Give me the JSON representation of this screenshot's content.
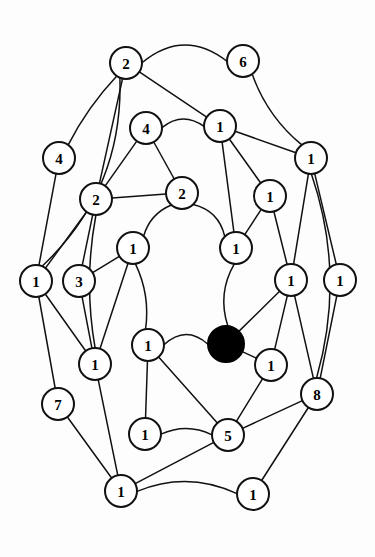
{
  "figure": {
    "name": "weighted-planar-graph",
    "background_color": "#fdfdfd",
    "node_fill": "#ffffff",
    "node_stroke": "#111111",
    "edge_color": "#111111",
    "highlight_color": "#000000",
    "width": 375,
    "height": 557
  },
  "chart_data": {
    "type": "diagram",
    "subtype": "node-link-graph",
    "title": "",
    "nodes": [
      {
        "id": "n1",
        "label": "2",
        "x": 126,
        "y": 63,
        "r": 16,
        "filled": false
      },
      {
        "id": "n2",
        "label": "6",
        "x": 243,
        "y": 61,
        "r": 16,
        "filled": false
      },
      {
        "id": "n3",
        "label": "4",
        "x": 146,
        "y": 128,
        "r": 16,
        "filled": false
      },
      {
        "id": "n4",
        "label": "1",
        "x": 220,
        "y": 126,
        "r": 16,
        "filled": false
      },
      {
        "id": "n5",
        "label": "1",
        "x": 311,
        "y": 158,
        "r": 16,
        "filled": false
      },
      {
        "id": "n6",
        "label": "4",
        "x": 59,
        "y": 158,
        "r": 16,
        "filled": false
      },
      {
        "id": "n7",
        "label": "2",
        "x": 96,
        "y": 199,
        "r": 16,
        "filled": false
      },
      {
        "id": "n8",
        "label": "2",
        "x": 182,
        "y": 193,
        "r": 16,
        "filled": false
      },
      {
        "id": "n9",
        "label": "1",
        "x": 270,
        "y": 196,
        "r": 16,
        "filled": false
      },
      {
        "id": "n10",
        "label": "1",
        "x": 133,
        "y": 248,
        "r": 16,
        "filled": false
      },
      {
        "id": "n11",
        "label": "1",
        "x": 236,
        "y": 248,
        "r": 16,
        "filled": false
      },
      {
        "id": "n12",
        "label": "1",
        "x": 36,
        "y": 281,
        "r": 16,
        "filled": false
      },
      {
        "id": "n13",
        "label": "3",
        "x": 79,
        "y": 281,
        "r": 16,
        "filled": false
      },
      {
        "id": "n14",
        "label": "1",
        "x": 291,
        "y": 280,
        "r": 16,
        "filled": false
      },
      {
        "id": "n15",
        "label": "1",
        "x": 340,
        "y": 280,
        "r": 16,
        "filled": false
      },
      {
        "id": "n16",
        "label": "",
        "x": 226,
        "y": 344,
        "r": 18,
        "filled": true
      },
      {
        "id": "n17",
        "label": "1",
        "x": 148,
        "y": 345,
        "r": 16,
        "filled": false
      },
      {
        "id": "n18",
        "label": "1",
        "x": 95,
        "y": 364,
        "r": 16,
        "filled": false
      },
      {
        "id": "n19",
        "label": "1",
        "x": 271,
        "y": 365,
        "r": 16,
        "filled": false
      },
      {
        "id": "n20",
        "label": "8",
        "x": 317,
        "y": 394,
        "r": 16,
        "filled": false
      },
      {
        "id": "n21",
        "label": "7",
        "x": 58,
        "y": 404,
        "r": 16,
        "filled": false
      },
      {
        "id": "n22",
        "label": "1",
        "x": 145,
        "y": 434,
        "r": 16,
        "filled": false
      },
      {
        "id": "n23",
        "label": "5",
        "x": 228,
        "y": 435,
        "r": 16,
        "filled": false
      },
      {
        "id": "n24",
        "label": "1",
        "x": 121,
        "y": 491,
        "r": 16,
        "filled": false
      },
      {
        "id": "n25",
        "label": "1",
        "x": 253,
        "y": 494,
        "r": 16,
        "filled": false
      }
    ],
    "edges": [
      {
        "from": "n1",
        "to": "n2",
        "curve": -34
      },
      {
        "from": "n1",
        "to": "n4",
        "curve": 0
      },
      {
        "from": "n1",
        "to": "n6",
        "curve": 6
      },
      {
        "from": "n1",
        "to": "n7",
        "curve": 0
      },
      {
        "from": "n2",
        "to": "n5",
        "curve": 12
      },
      {
        "from": "n3",
        "to": "n4",
        "curve": -16
      },
      {
        "from": "n3",
        "to": "n7",
        "curve": 0
      },
      {
        "from": "n3",
        "to": "n8",
        "curve": 0
      },
      {
        "from": "n4",
        "to": "n5",
        "curve": 0
      },
      {
        "from": "n4",
        "to": "n9",
        "curve": 0
      },
      {
        "from": "n4",
        "to": "n11",
        "curve": 0
      },
      {
        "from": "n5",
        "to": "n14",
        "curve": 0
      },
      {
        "from": "n5",
        "to": "n15",
        "curve": 0
      },
      {
        "from": "n6",
        "to": "n12",
        "curve": 0
      },
      {
        "from": "n7",
        "to": "n8",
        "curve": 0
      },
      {
        "from": "n7",
        "to": "n12",
        "curve": 0
      },
      {
        "from": "n7",
        "to": "n13",
        "curve": 0
      },
      {
        "from": "n7",
        "to": "n18",
        "curve": 12
      },
      {
        "from": "n8",
        "to": "n10",
        "curve": 10
      },
      {
        "from": "n8",
        "to": "n11",
        "curve": -14
      },
      {
        "from": "n9",
        "to": "n11",
        "curve": 0
      },
      {
        "from": "n9",
        "to": "n14",
        "curve": 0
      },
      {
        "from": "n10",
        "to": "n13",
        "curve": 0
      },
      {
        "from": "n10",
        "to": "n17",
        "curve": -10
      },
      {
        "from": "n10",
        "to": "n18",
        "curve": 0
      },
      {
        "from": "n11",
        "to": "n16",
        "curve": 14
      },
      {
        "from": "n12",
        "to": "n18",
        "curve": 0
      },
      {
        "from": "n12",
        "to": "n21",
        "curve": 0
      },
      {
        "from": "n13",
        "to": "n18",
        "curve": 0
      },
      {
        "from": "n14",
        "to": "n16",
        "curve": 0
      },
      {
        "from": "n14",
        "to": "n19",
        "curve": 0
      },
      {
        "from": "n14",
        "to": "n20",
        "curve": 0
      },
      {
        "from": "n15",
        "to": "n20",
        "curve": 0
      },
      {
        "from": "n16",
        "to": "n19",
        "curve": 0
      },
      {
        "from": "n16",
        "to": "n17",
        "curve": 20
      },
      {
        "from": "n17",
        "to": "n22",
        "curve": 0
      },
      {
        "from": "n17",
        "to": "n23",
        "curve": 0
      },
      {
        "from": "n18",
        "to": "n24",
        "curve": 0
      },
      {
        "from": "n19",
        "to": "n23",
        "curve": 0
      },
      {
        "from": "n20",
        "to": "n23",
        "curve": 0
      },
      {
        "from": "n20",
        "to": "n25",
        "curve": 0
      },
      {
        "from": "n21",
        "to": "n24",
        "curve": 0
      },
      {
        "from": "n22",
        "to": "n23",
        "curve": -12
      },
      {
        "from": "n23",
        "to": "n24",
        "curve": 0
      },
      {
        "from": "n24",
        "to": "n25",
        "curve": -22
      },
      {
        "from": "n1",
        "to": "n12",
        "curve": -46
      },
      {
        "from": "n5",
        "to": "n20",
        "curve": -32
      }
    ],
    "legend": [],
    "annotations": []
  }
}
